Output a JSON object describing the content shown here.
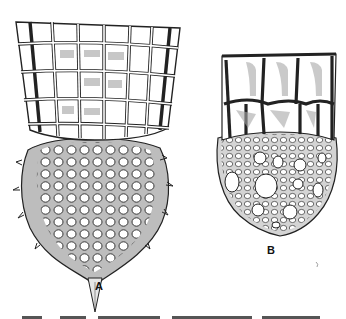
{
  "figure": {
    "panels": [
      {
        "id": "A",
        "label": "A",
        "subject": "tall specimen with square-mesh cylindrical collar, spiny latticed spherical body and apical spine"
      },
      {
        "id": "B",
        "label": "B",
        "subject": "shorter specimen with large-window collar over rounded latticed body with pores of varying size"
      }
    ],
    "caption": {
      "truncated": true
    }
  }
}
